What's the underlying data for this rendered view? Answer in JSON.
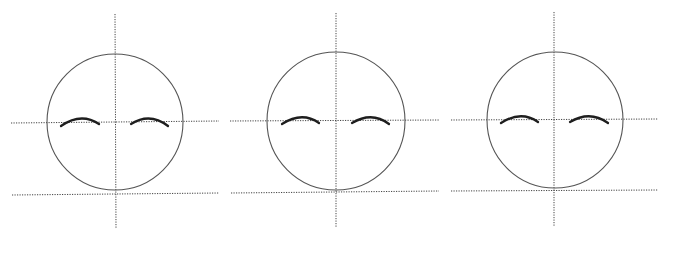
{
  "diagram": {
    "title": "",
    "background": "#ffffff",
    "colors": {
      "guide_line": "#444444",
      "head_outline": "#555555",
      "eyebrow": "#1e1e1e"
    },
    "faces": [
      {
        "label": "face-1",
        "circle": {
          "cx": 115,
          "cy": 122,
          "r": 68
        },
        "vertical_guide": {
          "x1": 115,
          "y1": 14,
          "x2": 116,
          "y2": 229
        },
        "eye_guide": {
          "x1": 11,
          "y1": 123,
          "x2": 219,
          "y2": 121
        },
        "chin_guide": {
          "x1": 12,
          "y1": 195,
          "x2": 219,
          "y2": 193
        },
        "left_brow": "M61,126 Q81,112 99,124",
        "right_brow": "M131,124 Q150,112 168,126"
      },
      {
        "label": "face-2",
        "circle": {
          "cx": 336,
          "cy": 121,
          "r": 69
        },
        "vertical_guide": {
          "x1": 336,
          "y1": 13,
          "x2": 336,
          "y2": 228
        },
        "eye_guide": {
          "x1": 230,
          "y1": 121,
          "x2": 439,
          "y2": 120
        },
        "chin_guide": {
          "x1": 231,
          "y1": 193,
          "x2": 439,
          "y2": 191
        },
        "left_brow": "M282,124 Q302,111 319,123",
        "right_brow": "M352,123 Q372,111 389,124"
      },
      {
        "label": "face-3",
        "circle": {
          "cx": 555,
          "cy": 120,
          "r": 68
        },
        "vertical_guide": {
          "x1": 554,
          "y1": 12,
          "x2": 554,
          "y2": 227
        },
        "eye_guide": {
          "x1": 451,
          "y1": 120,
          "x2": 658,
          "y2": 119
        },
        "chin_guide": {
          "x1": 451,
          "y1": 191,
          "x2": 658,
          "y2": 190
        },
        "left_brow": "M501,123 Q521,110 538,122",
        "right_brow": "M570,122 Q590,110 608,123"
      }
    ]
  }
}
